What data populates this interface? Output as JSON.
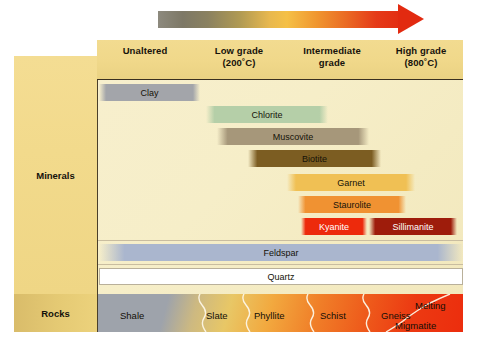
{
  "arrow": {
    "name": "temperature-increase-arrow",
    "direction": "right",
    "gradient_stops": [
      "#8d8a7e",
      "#b09a53",
      "#f5c046",
      "#f0962f",
      "#e22a10"
    ]
  },
  "columns": [
    {
      "label": "Unaltered",
      "sub": ""
    },
    {
      "label": "Low grade",
      "sub": "(200˚C)"
    },
    {
      "label": "Intermediate",
      "sub": "grade"
    },
    {
      "label": "High grade",
      "sub": "(800˚C)"
    }
  ],
  "row_labels": {
    "minerals": "Minerals",
    "rocks": "Rocks"
  },
  "minerals": [
    {
      "label": "Clay",
      "left": 1,
      "width": 101,
      "top": 4,
      "color": "#a3a5aa",
      "text": "dark"
    },
    {
      "label": "Chlorite",
      "left": 108,
      "width": 122,
      "top": 26,
      "color": "#b5cfa8",
      "text": "dark"
    },
    {
      "label": "Muscovite",
      "left": 119,
      "width": 152,
      "top": 48,
      "color": "#a6977a",
      "text": "dark"
    },
    {
      "label": "Biotite",
      "left": 150,
      "width": 133,
      "top": 70,
      "color": "#7c5d22",
      "text": "dark"
    },
    {
      "label": "Garnet",
      "left": 189,
      "width": 128,
      "top": 94,
      "color": "#f0c054",
      "text": "dark"
    },
    {
      "label": "Staurolite",
      "left": 200,
      "width": 108,
      "top": 116,
      "color": "#f09232",
      "text": "dark"
    },
    {
      "label": "Kyanite",
      "left": 203,
      "width": 66,
      "top": 138,
      "color": "#ed2a0c",
      "text": "light"
    },
    {
      "label": "Sillimanite",
      "left": 271,
      "width": 88,
      "top": 138,
      "color": "#9e1c0b",
      "text": "light"
    },
    {
      "label": "Feldspar",
      "left": 1,
      "width": 364,
      "top": 164,
      "color": "#aab6ce",
      "text": "dark"
    },
    {
      "label": "Quartz",
      "left": 1,
      "width": 364,
      "top": 188,
      "color": "#ffffff",
      "text": "dark"
    }
  ],
  "rocks": [
    {
      "label": "Shale",
      "x": 22,
      "y": 16
    },
    {
      "label": "Slate",
      "x": 108,
      "y": 16
    },
    {
      "label": "Phyllite",
      "x": 156,
      "y": 16
    },
    {
      "label": "Schist",
      "x": 222,
      "y": 16
    },
    {
      "label": "Gneiss",
      "x": 283,
      "y": 16
    },
    {
      "label": "Migmatite",
      "x": 297,
      "y": 26
    },
    {
      "label": "Melting",
      "x": 317,
      "y": 6
    }
  ],
  "colors": {
    "header_bg": "#f0d88a",
    "field_bg": "#f6eec8",
    "side_panel": "#f2da8c",
    "rocks_panel": "#e5ca74",
    "frame_line": "#4a3f2a"
  }
}
